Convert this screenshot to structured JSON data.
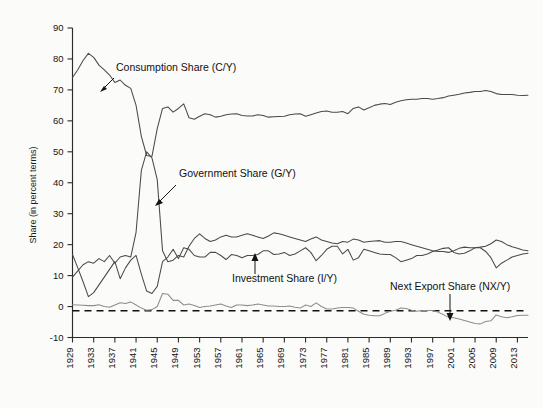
{
  "figure": {
    "title": "",
    "background_color": "#fbfbfa",
    "plot_line_color": "#4a4a4a",
    "axis_color": "#2b2b2b",
    "zero_line_color": "#111111"
  },
  "axes": {
    "ylabel": "Share (in percent terms)",
    "xlabel": "",
    "yticks": [
      "90",
      "80",
      "70",
      "60",
      "50",
      "40",
      "30",
      "20",
      "10",
      "0",
      "-10"
    ],
    "xticks": [
      "1929",
      "1933",
      "1937",
      "1941",
      "1945",
      "1949",
      "1953",
      "1957",
      "1961",
      "1965",
      "1969",
      "1973",
      "1977",
      "1981",
      "1985",
      "1989",
      "1993",
      "1997",
      "2001",
      "2005",
      "2009",
      "2013"
    ]
  },
  "annotations": [
    {
      "name": "consumption-share",
      "text": "Consumption Share (C/Y)"
    },
    {
      "name": "government-share",
      "text": "Government Share (G/Y)"
    },
    {
      "name": "investment-share",
      "text": "Investment Share (I/Y)"
    },
    {
      "name": "net-export-share",
      "text": "Next Export Share (NX/Y)"
    }
  ],
  "chart_data": {
    "type": "line",
    "title": "",
    "xlabel": "",
    "ylabel": "Share (in percent terms)",
    "xlim": [
      1929,
      2015
    ],
    "ylim": [
      -10,
      90
    ],
    "grid": false,
    "legend": "annotations-inline",
    "xticks": [
      1929,
      1933,
      1937,
      1941,
      1945,
      1949,
      1953,
      1957,
      1961,
      1965,
      1969,
      1973,
      1977,
      1981,
      1985,
      1989,
      1993,
      1997,
      2001,
      2005,
      2009,
      2013
    ],
    "yticks": [
      -10,
      0,
      10,
      20,
      30,
      40,
      50,
      60,
      70,
      80,
      90
    ],
    "x": [
      1929,
      1930,
      1931,
      1932,
      1933,
      1934,
      1935,
      1936,
      1937,
      1938,
      1939,
      1940,
      1941,
      1942,
      1943,
      1944,
      1945,
      1946,
      1947,
      1948,
      1949,
      1950,
      1951,
      1952,
      1953,
      1954,
      1955,
      1956,
      1957,
      1958,
      1959,
      1960,
      1961,
      1962,
      1963,
      1964,
      1965,
      1966,
      1967,
      1968,
      1969,
      1970,
      1971,
      1972,
      1973,
      1974,
      1975,
      1976,
      1977,
      1978,
      1979,
      1980,
      1981,
      1982,
      1983,
      1984,
      1985,
      1986,
      1987,
      1988,
      1989,
      1990,
      1991,
      1992,
      1993,
      1994,
      1995,
      1996,
      1997,
      1998,
      1999,
      2000,
      2001,
      2002,
      2003,
      2004,
      2005,
      2006,
      2007,
      2008,
      2009,
      2010,
      2011,
      2012,
      2013,
      2014,
      2015
    ],
    "series": [
      {
        "name": "Consumption Share (C/Y)",
        "key": "consumption",
        "values": [
          74.0,
          76.5,
          79.5,
          81.8,
          80.5,
          78.0,
          76.5,
          74.8,
          72.4,
          73.2,
          71.5,
          70.5,
          65.0,
          55.0,
          48.8,
          48.5,
          57.5,
          64.0,
          64.5,
          62.8,
          64.0,
          65.5,
          61.0,
          60.5,
          61.5,
          62.3,
          62.0,
          61.2,
          61.5,
          62.0,
          62.2,
          62.3,
          61.7,
          61.6,
          61.6,
          62.0,
          61.7,
          61.2,
          61.3,
          61.4,
          61.5,
          62.0,
          62.2,
          62.3,
          61.5,
          62.0,
          62.5,
          63.0,
          63.2,
          62.8,
          62.8,
          63.0,
          62.3,
          64.0,
          64.5,
          63.5,
          64.2,
          65.0,
          65.4,
          65.6,
          65.3,
          66.0,
          66.5,
          66.8,
          67.0,
          67.0,
          67.2,
          67.2,
          67.0,
          67.2,
          67.5,
          68.0,
          68.3,
          68.6,
          69.0,
          69.2,
          69.5,
          69.5,
          69.8,
          69.5,
          68.8,
          68.5,
          68.5,
          68.5,
          68.3,
          68.2,
          68.3
        ]
      },
      {
        "name": "Government Share (G/Y)",
        "key": "government",
        "values": [
          9.5,
          11.5,
          13.5,
          14.5,
          14.0,
          15.5,
          14.5,
          16.5,
          14.0,
          16.0,
          16.5,
          16.0,
          24.0,
          44.0,
          50.0,
          48.0,
          41.0,
          18.0,
          14.5,
          15.0,
          16.5,
          16.0,
          19.5,
          22.0,
          23.5,
          22.0,
          21.0,
          21.5,
          22.5,
          23.0,
          22.5,
          22.5,
          23.0,
          23.5,
          23.0,
          22.5,
          22.0,
          22.8,
          23.8,
          23.5,
          23.0,
          22.5,
          22.0,
          21.5,
          21.0,
          21.8,
          22.5,
          21.5,
          21.0,
          20.5,
          20.3,
          21.0,
          20.8,
          21.8,
          21.5,
          20.8,
          21.0,
          21.2,
          21.3,
          20.8,
          20.8,
          21.0,
          21.0,
          20.5,
          20.0,
          19.5,
          19.0,
          18.5,
          18.0,
          17.8,
          17.8,
          17.5,
          18.0,
          18.8,
          19.2,
          19.0,
          19.0,
          19.2,
          19.5,
          20.3,
          21.5,
          21.0,
          20.0,
          19.3,
          18.8,
          18.3,
          18.0
        ]
      },
      {
        "name": "Investment Share (I/Y)",
        "key": "investment",
        "values": [
          16.8,
          12.5,
          8.0,
          3.2,
          4.5,
          7.0,
          9.5,
          12.0,
          14.5,
          9.0,
          12.5,
          15.0,
          16.5,
          10.5,
          5.0,
          4.2,
          6.5,
          14.5,
          16.0,
          18.5,
          15.5,
          19.0,
          18.5,
          16.5,
          16.0,
          16.0,
          17.5,
          17.5,
          16.5,
          15.2,
          16.8,
          16.5,
          15.8,
          16.5,
          16.5,
          16.8,
          18.0,
          18.0,
          16.8,
          17.0,
          17.5,
          16.5,
          17.0,
          18.0,
          19.0,
          17.5,
          14.8,
          16.5,
          18.5,
          19.5,
          19.5,
          17.0,
          18.5,
          15.0,
          15.8,
          18.5,
          18.0,
          17.5,
          17.0,
          16.8,
          16.8,
          15.8,
          14.5,
          15.0,
          15.5,
          16.5,
          16.5,
          17.0,
          17.8,
          18.3,
          18.8,
          19.0,
          17.5,
          17.0,
          17.2,
          18.0,
          19.0,
          19.0,
          17.8,
          15.8,
          12.5,
          14.0,
          15.0,
          16.0,
          16.5,
          17.0,
          17.2
        ]
      },
      {
        "name": "Next Export Share (NX/Y)",
        "key": "net_exports",
        "values": [
          0.6,
          0.5,
          0.4,
          0.3,
          0.3,
          0.6,
          0.0,
          -0.2,
          0.5,
          1.2,
          1.0,
          1.5,
          0.5,
          -0.5,
          -1.2,
          -1.0,
          0.0,
          4.2,
          4.0,
          2.0,
          2.0,
          0.5,
          0.8,
          0.3,
          -0.3,
          0.0,
          0.2,
          0.5,
          0.8,
          0.2,
          -0.3,
          0.5,
          0.5,
          0.3,
          0.5,
          0.8,
          0.5,
          0.2,
          0.2,
          0.0,
          0.0,
          0.2,
          -0.2,
          -0.5,
          0.5,
          0.0,
          1.2,
          0.0,
          -0.8,
          -0.8,
          -0.5,
          -0.3,
          -0.3,
          -0.5,
          -1.5,
          -2.5,
          -2.8,
          -3.0,
          -3.0,
          -2.2,
          -1.5,
          -1.2,
          -0.5,
          -0.6,
          -1.2,
          -1.5,
          -1.3,
          -1.3,
          -1.3,
          -1.8,
          -2.6,
          -3.5,
          -3.6,
          -4.0,
          -4.5,
          -5.0,
          -5.5,
          -5.6,
          -4.8,
          -4.6,
          -2.7,
          -3.3,
          -3.6,
          -3.3,
          -2.9,
          -2.8,
          -2.8
        ]
      }
    ]
  }
}
